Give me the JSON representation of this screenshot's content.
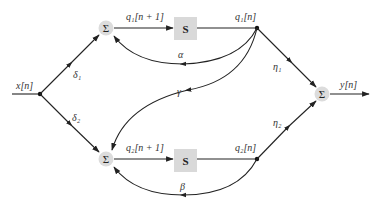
{
  "diagram": {
    "type": "signal-flow block diagram",
    "colors": {
      "wire": "#222222",
      "node_fill": "#dcdcdc",
      "delay_fill": "#d9d9d9",
      "text": "#333333"
    },
    "input": {
      "label": "x[n]"
    },
    "output": {
      "label": "y[n]"
    },
    "summers": {
      "top": {
        "symbol": "Σ"
      },
      "bottom": {
        "symbol": "Σ"
      },
      "out": {
        "symbol": "Σ"
      }
    },
    "delays": {
      "top": {
        "label": "S",
        "in_label": "q₁[n + 1]",
        "out_label": "q₁[n]"
      },
      "bottom": {
        "label": "S",
        "in_label": "q₂[n + 1]",
        "out_label": "q₂[n]"
      }
    },
    "gains": {
      "delta1": "δ₁",
      "delta2": "δ₂",
      "alpha": "α",
      "beta": "β",
      "gamma": "γ",
      "eta1": "η₁",
      "eta2": "η₂"
    }
  }
}
